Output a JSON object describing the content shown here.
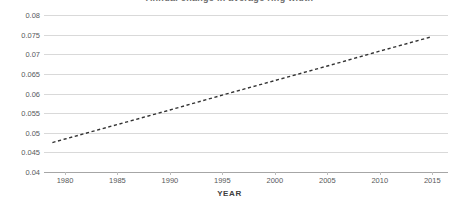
{
  "chart_data": {
    "type": "line",
    "title": "Annual change in average ring width",
    "xlabel": "YEAR",
    "ylabel": "",
    "xlim": [
      1978,
      2016.5
    ],
    "ylim": [
      0.04,
      0.08
    ],
    "grid": true,
    "legend": "none",
    "xticks": [
      1980,
      1985,
      1990,
      1995,
      2000,
      2005,
      2010,
      2015
    ],
    "xtick_labels": [
      "1980",
      "1985",
      "1990",
      "1995",
      "2000",
      "2005",
      "2010",
      "2015"
    ],
    "yticks": [
      0.04,
      0.045,
      0.05,
      0.055,
      0.06,
      0.065,
      0.07,
      0.075,
      0.08
    ],
    "ytick_labels": [
      "0.04",
      "0.045",
      "0.05",
      "0.055",
      "0.06",
      "0.065",
      "0.07",
      "0.075",
      "0.08"
    ],
    "series": [
      {
        "name": "trend",
        "style": "dashed",
        "color": "#333333",
        "x": [
          1978.8,
          2015.0
        ],
        "values": [
          0.0475,
          0.0745
        ],
        "points": [
          {
            "x": 1978.8,
            "y": 0.0475
          },
          {
            "x": 1980.0,
            "y": 0.0484
          },
          {
            "x": 1985.0,
            "y": 0.0521
          },
          {
            "x": 1990.0,
            "y": 0.0558
          },
          {
            "x": 1995.0,
            "y": 0.0596
          },
          {
            "x": 2000.0,
            "y": 0.0633
          },
          {
            "x": 2005.0,
            "y": 0.067
          },
          {
            "x": 2010.0,
            "y": 0.0708
          },
          {
            "x": 2015.0,
            "y": 0.0745
          }
        ]
      }
    ],
    "colors": {
      "background": "#ffffff",
      "gridline": "#d9d9d9",
      "axis": "#a6a6a6",
      "tick_text": "#58595b",
      "trendline": "#333333"
    }
  }
}
